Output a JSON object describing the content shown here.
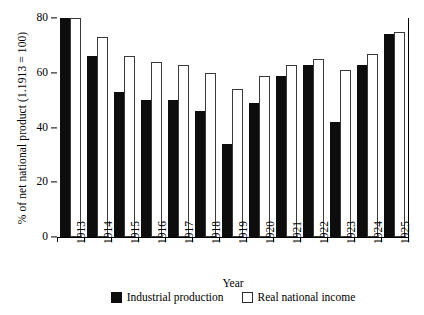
{
  "chart_data": {
    "type": "bar",
    "title": "",
    "xlabel": "Year",
    "ylabel": "% of net national product (1.1913 = 100)",
    "categories": [
      "1913",
      "1914",
      "1915",
      "1916",
      "1917",
      "1918",
      "1919",
      "1920",
      "1921",
      "1922",
      "1923",
      "1924",
      "1925"
    ],
    "series": [
      {
        "name": "Industrial production",
        "color": "#0d0d0d",
        "style": "filled",
        "values": [
          80,
          66,
          53,
          50,
          50,
          46,
          34,
          49,
          59,
          63,
          42,
          63,
          74
        ]
      },
      {
        "name": "Real national income",
        "color": "#ffffff",
        "style": "outlined",
        "values": [
          80,
          73,
          66,
          64,
          63,
          60,
          54,
          59,
          63,
          65,
          61,
          67,
          75
        ]
      }
    ],
    "ylim": [
      0,
      80
    ],
    "yticks": [
      0,
      20,
      40,
      60,
      80
    ],
    "ytick_labels": [
      "0",
      "20",
      "40",
      "60",
      "80"
    ],
    "grid": false,
    "legend_position": "bottom",
    "xtick_rotation": 90
  },
  "axes": {
    "y_title": "% of net national product (1.1913 = 100)",
    "x_title": "Year"
  },
  "legend": {
    "items": [
      {
        "label": "Industrial production",
        "swatch": "filled-black-square"
      },
      {
        "label": "Real national income",
        "swatch": "outlined-white-square"
      }
    ]
  }
}
